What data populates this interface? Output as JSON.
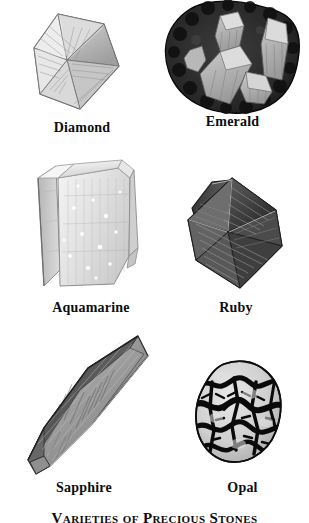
{
  "plate": {
    "title": "Varieties of Precious Stones",
    "title_visible_portion": "Varieties of Precious Stones",
    "background_color": "#ffffff",
    "ink_color": "#0d0d0d",
    "width": 309,
    "height": 523,
    "columns": 2,
    "rows": 3
  },
  "specimens": [
    {
      "id": "diamond",
      "label": "Diamond",
      "icon": "diamond-crystal-icon",
      "row": 1,
      "column": 1,
      "habit": "octahedron",
      "tone": "light",
      "fill_color": "#d8d8d8",
      "outline_color": "#3a3a3a"
    },
    {
      "id": "emerald",
      "label": "Emerald",
      "icon": "emerald-crystal-icon",
      "row": 1,
      "column": 2,
      "habit": "hexagonal prisms in matrix",
      "tone": "dark",
      "fill_color": "#2b2b2b",
      "outline_color": "#141414"
    },
    {
      "id": "aquamarine",
      "label": "Aquamarine",
      "icon": "aquamarine-crystal-icon",
      "row": 2,
      "column": 1,
      "habit": "prismatic beryl",
      "tone": "very light",
      "fill_color": "#e4e4e4",
      "outline_color": "#8c8c8c"
    },
    {
      "id": "ruby",
      "label": "Ruby",
      "icon": "ruby-crystal-icon",
      "row": 2,
      "column": 2,
      "habit": "bipyramid",
      "tone": "dark",
      "fill_color": "#555555",
      "outline_color": "#1a1a1a"
    },
    {
      "id": "sapphire",
      "label": "Sapphire",
      "icon": "sapphire-crystal-icon",
      "row": 3,
      "column": 1,
      "habit": "elongated bipyramid",
      "tone": "medium",
      "fill_color": "#8a8a8a",
      "outline_color": "#2c2c2c"
    },
    {
      "id": "opal",
      "label": "Opal",
      "icon": "opal-nodule-icon",
      "row": 3,
      "column": 2,
      "habit": "rounded nodule",
      "tone": "mottled",
      "fill_color": "#cfcfcf",
      "outline_color": "#101010"
    }
  ]
}
